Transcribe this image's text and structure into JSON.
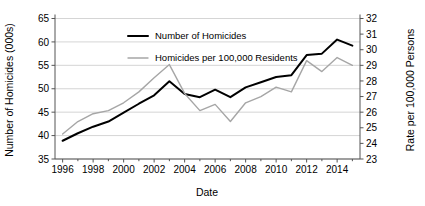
{
  "chart_data": {
    "type": "line",
    "title": "",
    "xlabel": "Date",
    "ylabel": "Number of Homicides (000s)",
    "ylabel_right": "Rate per 100,000 Persons",
    "x": [
      1996,
      1997,
      1998,
      1999,
      2000,
      2001,
      2002,
      2003,
      2004,
      2005,
      2006,
      2007,
      2008,
      2009,
      2010,
      2011,
      2012,
      2013,
      2014,
      2015
    ],
    "xlim": [
      1995.5,
      2015.5
    ],
    "xticks": [
      1996,
      1998,
      2000,
      2002,
      2004,
      2006,
      2008,
      2010,
      2012,
      2014
    ],
    "xtick_labels": [
      "1996",
      "1998",
      "2000",
      "2002",
      "2004",
      "2006",
      "2008",
      "2010",
      "2012",
      "2014"
    ],
    "ylim": [
      35,
      65
    ],
    "yticks": [
      35,
      40,
      45,
      50,
      55,
      60,
      65
    ],
    "ytick_labels": [
      "35",
      "40",
      "45",
      "50",
      "55",
      "60",
      "65"
    ],
    "ylim_right": [
      23,
      32
    ],
    "yticks_right": [
      23,
      24,
      25,
      26,
      27,
      28,
      29,
      30,
      31,
      32
    ],
    "ytick_labels_right": [
      "23",
      "24",
      "25",
      "26",
      "27",
      "28",
      "29",
      "30",
      "31",
      "32"
    ],
    "grid": true,
    "legend_position": "top-center",
    "series": [
      {
        "name": "Number of Homicides",
        "axis": "left",
        "color": "#000000",
        "values": [
          38.9,
          40.5,
          41.9,
          43.0,
          44.9,
          46.8,
          48.6,
          51.6,
          48.9,
          48.2,
          49.8,
          48.2,
          50.3,
          51.4,
          52.5,
          52.9,
          57.2,
          57.5,
          60.5,
          59.2
        ]
      },
      {
        "name": "Homicides per 100,000 Residents",
        "axis": "right",
        "color": "#a6a6a6",
        "values": [
          24.6,
          25.4,
          25.9,
          26.1,
          26.6,
          27.3,
          28.2,
          29.05,
          27.2,
          26.1,
          26.5,
          25.4,
          26.6,
          27.0,
          27.6,
          27.3,
          29.3,
          28.6,
          29.5,
          29.0
        ]
      }
    ]
  },
  "legend": {
    "items": [
      {
        "label": "Number of Homicides",
        "color": "#000000"
      },
      {
        "label": "Homicides per 100,000 Residents",
        "color": "#a6a6a6"
      }
    ]
  }
}
